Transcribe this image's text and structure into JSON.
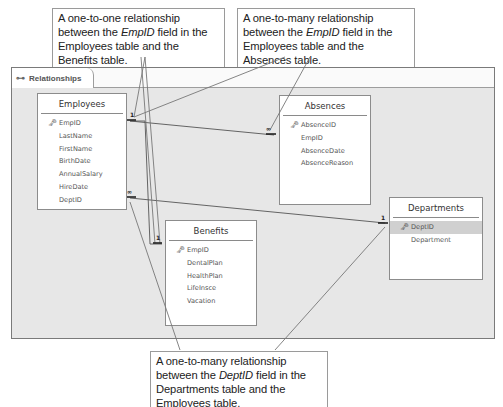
{
  "window": {
    "tab_label": "Relationships",
    "tab_icon": "relationships-icon"
  },
  "tables": {
    "employees": {
      "title": "Employees",
      "fields": [
        "EmpID",
        "LastName",
        "FirstName",
        "BirthDate",
        "AnnualSalary",
        "HireDate",
        "DeptID"
      ],
      "primary_key": "EmpID"
    },
    "absences": {
      "title": "Absences",
      "fields": [
        "AbsenceID",
        "EmpID",
        "AbsenceDate",
        "AbsenceReason"
      ],
      "primary_key": "AbsenceID"
    },
    "benefits": {
      "title": "Benefits",
      "fields": [
        "EmpID",
        "DentalPlan",
        "HealthPlan",
        "LifeInsce",
        "Vacation"
      ],
      "primary_key": "EmpID"
    },
    "departments": {
      "title": "Departments",
      "fields": [
        "DeptID",
        "Department"
      ],
      "primary_key": "DeptID",
      "selected_field": "DeptID"
    }
  },
  "relationships": [
    {
      "from": "Employees.EmpID",
      "to": "Benefits.EmpID",
      "type": "one-to-one",
      "from_symbol": "1",
      "to_symbol": "1"
    },
    {
      "from": "Employees.EmpID",
      "to": "Absences.EmpID",
      "type": "one-to-many",
      "from_symbol": "1",
      "to_symbol": "∞"
    },
    {
      "from": "Departments.DeptID",
      "to": "Employees.DeptID",
      "type": "one-to-many",
      "from_symbol": "1",
      "to_symbol": "∞"
    }
  ],
  "callouts": {
    "one_to_one": {
      "pre": "A one-to-one relationship between the ",
      "em": "EmpID",
      "post": " field in the Employees table and the Benefits table."
    },
    "one_to_many_absences": {
      "pre": "A one-to-many relationship between the ",
      "em": "EmpID",
      "post": " field in the Employees table and the Absences table."
    },
    "one_to_many_depts": {
      "pre": "A one-to-many relationship between the ",
      "em": "DeptID",
      "post": " field in the Departments table and the Employees table."
    }
  }
}
